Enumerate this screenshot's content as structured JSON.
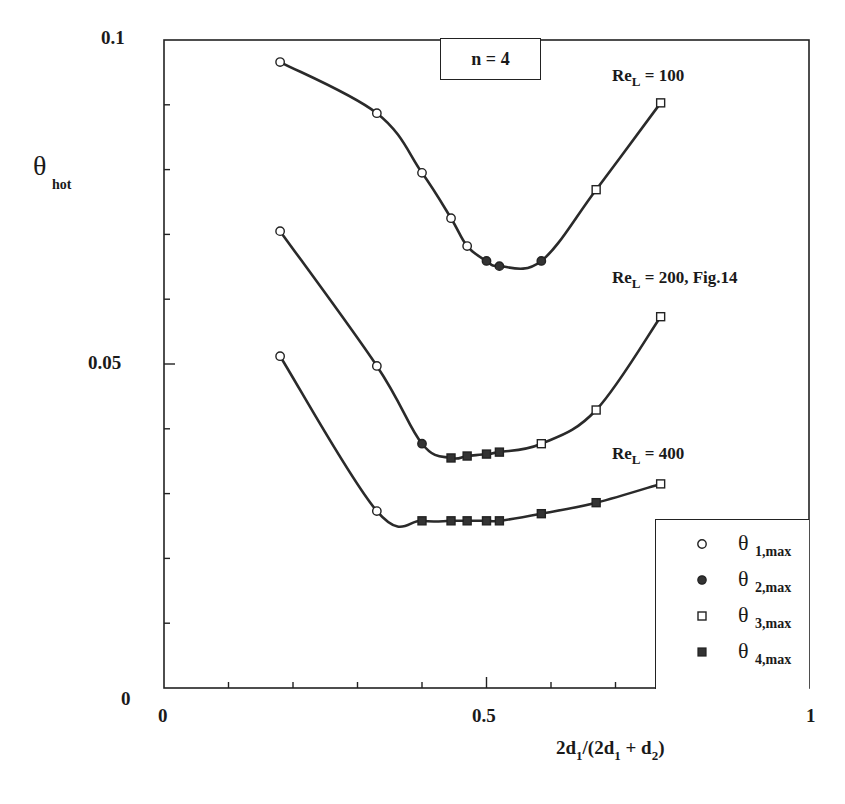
{
  "chart_data": {
    "type": "line",
    "title": "",
    "xlabel": "2d1/(2d1 + d2)",
    "ylabel": "θ_hot",
    "xlim": [
      0,
      1
    ],
    "ylim": [
      0,
      0.1
    ],
    "x_tick_labels": [
      "0",
      "0.5",
      "1"
    ],
    "y_tick_labels": [
      "0",
      "0.05",
      "0.1"
    ],
    "x_minor_tick_step": 0.1,
    "y_minor_tick_step": 0.01,
    "grid": false,
    "legend_position": "lower right",
    "annotations": [
      "n = 4",
      "Re_L = 100",
      "Re_L = 200, Fig.14",
      "Re_L = 400"
    ],
    "legend": [
      {
        "marker": "open-circle",
        "label": "θ 1,max"
      },
      {
        "marker": "filled-circle",
        "label": "θ 2,max"
      },
      {
        "marker": "open-square",
        "label": "θ 3,max"
      },
      {
        "marker": "filled-square",
        "label": "θ 4,max"
      }
    ],
    "series": [
      {
        "name": "Re_L = 100",
        "x": [
          0.18,
          0.33,
          0.4,
          0.445,
          0.47,
          0.5,
          0.52,
          0.585,
          0.67,
          0.77
        ],
        "values": [
          0.0966,
          0.0887,
          0.0795,
          0.0725,
          0.0682,
          0.0659,
          0.0651,
          0.0659,
          0.0769,
          0.0903
        ],
        "markers": [
          "open-circle",
          "open-circle",
          "open-circle",
          "open-circle",
          "open-circle",
          "filled-circle",
          "filled-circle",
          "filled-circle",
          "open-square",
          "open-square"
        ]
      },
      {
        "name": "Re_L = 200, Fig.14",
        "x": [
          0.18,
          0.33,
          0.4,
          0.445,
          0.47,
          0.5,
          0.52,
          0.585,
          0.67,
          0.77
        ],
        "values": [
          0.0705,
          0.0497,
          0.0377,
          0.0355,
          0.0358,
          0.0361,
          0.0364,
          0.0377,
          0.0429,
          0.0573
        ],
        "markers": [
          "open-circle",
          "open-circle",
          "filled-circle",
          "filled-square",
          "filled-square",
          "filled-square",
          "filled-square",
          "open-square",
          "open-square",
          "open-square"
        ]
      },
      {
        "name": "Re_L = 400",
        "x": [
          0.18,
          0.33,
          0.4,
          0.445,
          0.47,
          0.5,
          0.52,
          0.585,
          0.67,
          0.77
        ],
        "values": [
          0.0512,
          0.0273,
          0.0258,
          0.0258,
          0.0258,
          0.0258,
          0.0258,
          0.0269,
          0.0286,
          0.0315
        ],
        "markers": [
          "open-circle",
          "open-circle",
          "filled-square",
          "filled-square",
          "filled-square",
          "filled-square",
          "filled-square",
          "filled-square",
          "filled-square",
          "open-square"
        ]
      }
    ]
  },
  "labels": {
    "n_box": "n = 4",
    "re100_main": "Re",
    "re100_sub": "L",
    "re100_rest": " = 100",
    "re200_main": "Re",
    "re200_sub": "L",
    "re200_rest": " = 200, Fig.14",
    "re400_main": "Re",
    "re400_sub": "L",
    "re400_rest": " = 400",
    "y_axis_symbol": "θ",
    "y_axis_sub": "hot",
    "x_axis": {
      "p1": "2d",
      "s1": "1",
      "p2": "/(2d",
      "s2": "1",
      "p3": " + d",
      "s3": "2",
      "p4": ")"
    },
    "y_ticks": {
      "top": "0.1",
      "mid": "0.05",
      "bottom": "0"
    },
    "x_ticks": {
      "left": "0",
      "mid": "0.5",
      "right": "1"
    },
    "legend": [
      {
        "symbol": "θ",
        "sub": "1,max"
      },
      {
        "symbol": "θ",
        "sub": "2,max"
      },
      {
        "symbol": "θ",
        "sub": "3,max"
      },
      {
        "symbol": "θ",
        "sub": "4,max"
      }
    ]
  },
  "colors": {
    "ink": "#222222",
    "background": "#ffffff"
  }
}
